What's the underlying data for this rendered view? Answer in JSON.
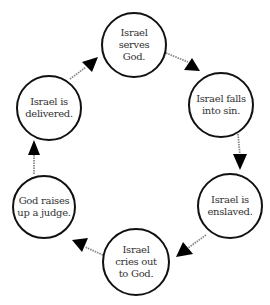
{
  "diagram": {
    "type": "cycle",
    "colors": {
      "background": "#ffffff",
      "node_border": "#111111",
      "text": "#333333",
      "connector": "#888888",
      "arrowhead": "#000000"
    },
    "nodes": [
      {
        "id": "serves",
        "label": "Israel\nserves\nGod.",
        "cx": 134,
        "cy": 45,
        "r": 33
      },
      {
        "id": "falls",
        "label": "Israel falls\ninto sin.",
        "cx": 221,
        "cy": 105,
        "r": 33
      },
      {
        "id": "enslaved",
        "label": "Israel is\nenslaved.",
        "cx": 230,
        "cy": 206,
        "r": 33
      },
      {
        "id": "cries",
        "label": "Israel\ncries out\nto God.",
        "cx": 136,
        "cy": 262,
        "r": 34
      },
      {
        "id": "judge",
        "label": "God raises\nup a judge.",
        "cx": 44,
        "cy": 207,
        "r": 32
      },
      {
        "id": "delivered",
        "label": "Israel is\ndelivered.",
        "cx": 49,
        "cy": 108,
        "r": 33
      }
    ],
    "edges": [
      {
        "from": "serves",
        "to": "falls"
      },
      {
        "from": "falls",
        "to": "enslaved"
      },
      {
        "from": "enslaved",
        "to": "cries"
      },
      {
        "from": "cries",
        "to": "judge"
      },
      {
        "from": "judge",
        "to": "delivered"
      },
      {
        "from": "delivered",
        "to": "serves"
      }
    ]
  }
}
